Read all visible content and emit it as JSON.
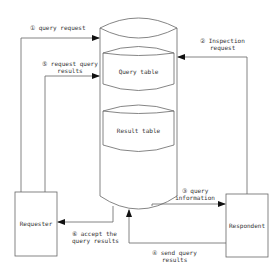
{
  "diagram": {
    "type": "flow",
    "colors": {
      "line": "#555555",
      "arrow": "#111111",
      "text": "#333333",
      "background": "#ffffff"
    },
    "database": {
      "shape": "cylinder",
      "tables": [
        {
          "id": "query",
          "label": "Query table"
        },
        {
          "id": "result",
          "label": "Result table"
        }
      ]
    },
    "actors": {
      "requester": {
        "label": "Requester"
      },
      "respondent": {
        "label": "Respondent"
      }
    },
    "steps": [
      {
        "num": "①",
        "line1": "query request",
        "line2": ""
      },
      {
        "num": "②",
        "line1": "Inspection",
        "line2": "request"
      },
      {
        "num": "③",
        "line1": "query",
        "line2": "information"
      },
      {
        "num": "④",
        "line1": "send query",
        "line2": "results"
      },
      {
        "num": "⑤",
        "line1": "request query",
        "line2": "results"
      },
      {
        "num": "⑥",
        "line1": "accept the",
        "line2": "query results"
      }
    ]
  }
}
